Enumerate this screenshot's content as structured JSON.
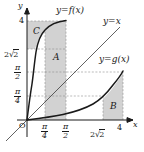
{
  "figure": {
    "background_color": "#ffffff",
    "shade_color": "#d2d2d2",
    "curve_color": "#1a1a1a",
    "grid_color": "#9a9a9a",
    "axis_color": "#1a1a1a"
  },
  "axes": {
    "x_axis_name": "x",
    "y_axis_name": "y",
    "origin_label": "O",
    "x_ticks": [
      {
        "label_num": "π",
        "label_den": "4",
        "kind": "fraction",
        "value": 0.7854
      },
      {
        "label_num": "π",
        "label_den": "2",
        "kind": "fraction",
        "value": 1.5708
      },
      {
        "label": "2√2",
        "kind": "radical",
        "coef": "2",
        "radicand": "2",
        "value": 2.8284
      },
      {
        "label": "4",
        "kind": "plain",
        "value": 4
      }
    ],
    "y_ticks": [
      {
        "label": "4",
        "kind": "plain",
        "value": 4
      },
      {
        "label": "2√2",
        "kind": "radical",
        "coef": "2",
        "radicand": "2",
        "value": 2.8284
      },
      {
        "label_num": "π",
        "label_den": "2",
        "kind": "fraction",
        "value": 1.5708
      },
      {
        "label_num": "π",
        "label_den": "4",
        "kind": "fraction",
        "value": 0.7854
      }
    ]
  },
  "curves": [
    {
      "name": "f",
      "label": "y=f(x)",
      "description": "increasing concave-down curve through origin reaching (pi/2, 4)"
    },
    {
      "name": "identity",
      "label": "y=x",
      "description": "straight diagonal line through origin with slope 1"
    },
    {
      "name": "g",
      "label": "y=g(x)",
      "description": "increasing convex curve through origin, inverse of f, reaching (4, pi/2)"
    }
  ],
  "regions": [
    {
      "name": "A",
      "label": "A",
      "description": "vertical strip between x=pi/4 and x=pi/2 under y=f(x)"
    },
    {
      "name": "B",
      "label": "B",
      "description": "vertical strip between x=2sqrt2 and x=4 under y=g(x)"
    },
    {
      "name": "C",
      "label": "C",
      "description": "horizontal strip between y=2sqrt2 and y=4 left of y=f(x)"
    }
  ]
}
